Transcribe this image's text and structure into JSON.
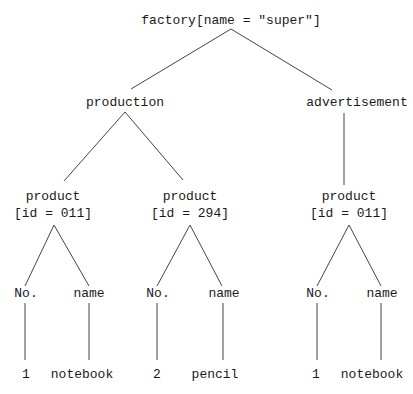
{
  "tree": {
    "root": {
      "label": "factory[name = \"super\"]"
    },
    "level1": [
      {
        "label": "production"
      },
      {
        "label": "advertisement"
      }
    ],
    "products": [
      {
        "label": "product",
        "attr": "[id = 011]"
      },
      {
        "label": "product",
        "attr": "[id = 294]"
      },
      {
        "label": "product",
        "attr": "[id = 011]"
      }
    ],
    "fields": [
      {
        "no_label": "No.",
        "name_label": "name",
        "no_value": "1",
        "name_value": "notebook"
      },
      {
        "no_label": "No.",
        "name_label": "name",
        "no_value": "2",
        "name_value": "pencil"
      },
      {
        "no_label": "No.",
        "name_label": "name",
        "no_value": "1",
        "name_value": "notebook"
      }
    ]
  },
  "colors": {
    "line": "#333333",
    "text": "#1a1a1a",
    "background": "#ffffff"
  }
}
